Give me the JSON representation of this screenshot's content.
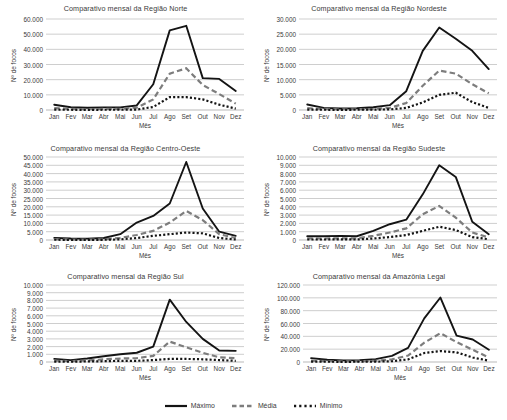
{
  "legend": {
    "items": [
      {
        "label": "Máximo",
        "style": "solid",
        "color": "#141414"
      },
      {
        "label": "Média",
        "style": "dashed",
        "color": "#7d7d7d"
      },
      {
        "label": "Mínimo",
        "style": "dotted",
        "color": "#141414"
      }
    ]
  },
  "common": {
    "xlabel": "Mês",
    "ylabel": "Nº de focos",
    "categories": [
      "Jan",
      "Fev",
      "Mar",
      "Abr",
      "Mai",
      "Jun",
      "Jul",
      "Ago",
      "Set",
      "Out",
      "Nov",
      "Dez"
    ]
  },
  "chart_data": [
    {
      "type": "line",
      "title": "Comparativo mensal da Região Norte",
      "xlabel": "Mês",
      "ylabel": "Nº de focos",
      "categories": [
        "Jan",
        "Fev",
        "Mar",
        "Abr",
        "Mai",
        "Jun",
        "Jul",
        "Ago",
        "Set",
        "Out",
        "Nov",
        "Dez"
      ],
      "ylim": [
        0,
        60000
      ],
      "yticks": [
        "0",
        "10.000",
        "20.000",
        "30.000",
        "40.000",
        "50.000",
        "60.000"
      ],
      "ytick_values": [
        0,
        10000,
        20000,
        30000,
        40000,
        50000,
        60000
      ],
      "grid": true,
      "series": [
        {
          "name": "Máximo",
          "values": [
            3500,
            1800,
            1500,
            1700,
            1700,
            3000,
            17000,
            52500,
            55500,
            21000,
            20500,
            12500
          ]
        },
        {
          "name": "Média",
          "values": [
            1200,
            700,
            600,
            700,
            800,
            1500,
            7000,
            24000,
            27500,
            16500,
            10500,
            4200
          ]
        },
        {
          "name": "Mínimo",
          "values": [
            200,
            150,
            120,
            150,
            200,
            300,
            2000,
            8500,
            8500,
            7000,
            3500,
            900
          ]
        }
      ]
    },
    {
      "type": "line",
      "title": "Comparativo mensal da Região Nordeste",
      "xlabel": "Mês",
      "ylabel": "Nº de focos",
      "categories": [
        "Jan",
        "Fev",
        "Mar",
        "Abr",
        "Mai",
        "Jun",
        "Jul",
        "Ago",
        "Set",
        "Out",
        "Nov",
        "Dez"
      ],
      "ylim": [
        0,
        30000
      ],
      "yticks": [
        "0",
        "5.000",
        "10.000",
        "15.000",
        "20.000",
        "25.000",
        "30.000"
      ],
      "ytick_values": [
        0,
        5000,
        10000,
        15000,
        20000,
        25000,
        30000
      ],
      "grid": true,
      "series": [
        {
          "name": "Máximo",
          "values": [
            1800,
            700,
            500,
            600,
            900,
            1600,
            6200,
            19500,
            27200,
            23500,
            19500,
            13500
          ]
        },
        {
          "name": "Média",
          "values": [
            600,
            300,
            250,
            250,
            350,
            700,
            2300,
            8000,
            13000,
            12000,
            8500,
            5500
          ]
        },
        {
          "name": "Mínimo",
          "values": [
            150,
            80,
            60,
            80,
            120,
            200,
            700,
            2500,
            5000,
            5700,
            2600,
            700
          ]
        }
      ]
    },
    {
      "type": "line",
      "title": "Comparativo mensal da Região Centro-Oeste",
      "xlabel": "Mês",
      "ylabel": "Nº de focos",
      "categories": [
        "Jan",
        "Fev",
        "Mar",
        "Abr",
        "Mai",
        "Jun",
        "Jul",
        "Ago",
        "Set",
        "Out",
        "Nov",
        "Dez"
      ],
      "ylim": [
        0,
        50000
      ],
      "yticks": [
        "0",
        "5.000",
        "10.000",
        "15.000",
        "20.000",
        "25.000",
        "30.000",
        "35.000",
        "40.000",
        "45.000",
        "50.000"
      ],
      "ytick_values": [
        0,
        5000,
        10000,
        15000,
        20000,
        25000,
        30000,
        35000,
        40000,
        45000,
        50000
      ],
      "grid": true,
      "series": [
        {
          "name": "Máximo",
          "values": [
            1300,
            900,
            800,
            1200,
            3500,
            10500,
            14500,
            22000,
            47000,
            19000,
            5000,
            2500
          ]
        },
        {
          "name": "Média",
          "values": [
            500,
            300,
            250,
            400,
            1300,
            3000,
            5500,
            10500,
            17500,
            12000,
            3500,
            1200
          ]
        },
        {
          "name": "Mínimo",
          "values": [
            150,
            100,
            80,
            120,
            400,
            1200,
            2500,
            3500,
            4500,
            4000,
            1200,
            300
          ]
        }
      ]
    },
    {
      "type": "line",
      "title": "Comparativo mensal da Região Sudeste",
      "xlabel": "Mês",
      "ylabel": "Nº de focos",
      "categories": [
        "Jan",
        "Fev",
        "Mar",
        "Abr",
        "Mai",
        "Jun",
        "Jul",
        "Ago",
        "Set",
        "Out",
        "Nov",
        "Dez"
      ],
      "ylim": [
        0,
        10000
      ],
      "yticks": [
        "0",
        "1.000",
        "2.000",
        "3.000",
        "4.000",
        "5.000",
        "6.000",
        "7.000",
        "8.000",
        "9.000",
        "10.000"
      ],
      "ytick_values": [
        0,
        1000,
        2000,
        3000,
        4000,
        5000,
        6000,
        7000,
        8000,
        9000,
        10000
      ],
      "grid": true,
      "series": [
        {
          "name": "Máximo",
          "values": [
            450,
            450,
            500,
            450,
            1100,
            1900,
            2450,
            5500,
            9000,
            7600,
            2200,
            700
          ]
        },
        {
          "name": "Média",
          "values": [
            200,
            180,
            200,
            200,
            500,
            900,
            1400,
            3100,
            4100,
            2700,
            900,
            300
          ]
        },
        {
          "name": "Mínimo",
          "values": [
            60,
            60,
            70,
            60,
            180,
            350,
            600,
            1100,
            1600,
            1200,
            350,
            90
          ]
        }
      ]
    },
    {
      "type": "line",
      "title": "Comparativo mensal da Região Sul",
      "xlabel": "Mês",
      "ylabel": "Nº de focos",
      "categories": [
        "Jan",
        "Fev",
        "Mar",
        "Abr",
        "Mai",
        "Jun",
        "Jul",
        "Ago",
        "Set",
        "Out",
        "Nov",
        "Dez"
      ],
      "ylim": [
        0,
        10000
      ],
      "yticks": [
        "0",
        "1.000",
        "2.000",
        "3.000",
        "4.000",
        "5.000",
        "6.000",
        "7.000",
        "8.000",
        "9.000",
        "10.000"
      ],
      "ytick_values": [
        0,
        1000,
        2000,
        3000,
        4000,
        5000,
        6000,
        7000,
        8000,
        9000,
        10000
      ],
      "grid": true,
      "series": [
        {
          "name": "Máximo",
          "values": [
            400,
            250,
            450,
            750,
            1000,
            1200,
            2000,
            8100,
            5200,
            3000,
            1500,
            1450
          ]
        },
        {
          "name": "Média",
          "values": [
            180,
            120,
            200,
            350,
            450,
            500,
            800,
            2650,
            1900,
            1200,
            600,
            500
          ]
        },
        {
          "name": "Mínimo",
          "values": [
            60,
            40,
            70,
            100,
            150,
            150,
            250,
            400,
            400,
            350,
            250,
            150
          ]
        }
      ]
    },
    {
      "type": "line",
      "title": "Comparativo mensal da Amazônia Legal",
      "xlabel": "Mês",
      "ylabel": "Nº de focos",
      "categories": [
        "Jan",
        "Fev",
        "Mar",
        "Abr",
        "Mai",
        "Jun",
        "Jul",
        "Ago",
        "Set",
        "Out",
        "Nov",
        "Dez"
      ],
      "ylim": [
        0,
        120000
      ],
      "yticks": [
        "0",
        "20.000",
        "40.000",
        "60.000",
        "80.000",
        "100.000",
        "120.000"
      ],
      "ytick_values": [
        0,
        20000,
        40000,
        60000,
        80000,
        100000,
        120000
      ],
      "grid": true,
      "series": [
        {
          "name": "Máximo",
          "values": [
            6000,
            3500,
            2500,
            3000,
            4500,
            9500,
            22000,
            68000,
            100500,
            41000,
            35000,
            19000
          ]
        },
        {
          "name": "Média",
          "values": [
            2200,
            1200,
            900,
            1200,
            1800,
            4000,
            10000,
            30000,
            45000,
            31000,
            19000,
            7000
          ]
        },
        {
          "name": "Mínimo",
          "values": [
            600,
            400,
            300,
            400,
            600,
            1200,
            4000,
            14000,
            17000,
            15000,
            7000,
            2000
          ]
        }
      ]
    }
  ]
}
